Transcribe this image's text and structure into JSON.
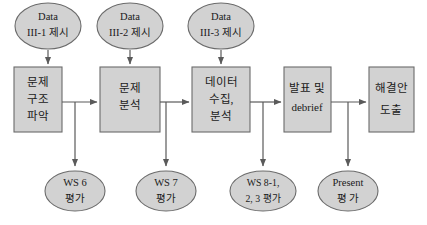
{
  "diagram": {
    "colors": {
      "shape_fill": "#d2d2d2",
      "shape_border": "#6b6b6b",
      "connector": "#5a5a5a",
      "text": "#1a1a1a",
      "background": "#ffffff"
    },
    "input_nodes": [
      {
        "id": "data-3-1",
        "line1": "Data",
        "line2": "III-1 제시"
      },
      {
        "id": "data-3-2",
        "line1": "Data",
        "line2": "III-2 제시"
      },
      {
        "id": "data-3-3",
        "line1": "Data",
        "line2": "III-3 제시"
      }
    ],
    "process_nodes": [
      {
        "id": "problem-structure",
        "line1": "문제",
        "line2": "구조",
        "line3": "파악"
      },
      {
        "id": "problem-analysis",
        "line1": "문제",
        "line2": "분석",
        "line3": ""
      },
      {
        "id": "data-collection",
        "line1": "데이터",
        "line2": "수집,",
        "line3": "분석"
      },
      {
        "id": "presentation-debrief",
        "line1": "발표 및",
        "line2": "debrief",
        "line3": ""
      },
      {
        "id": "solution-derivation",
        "line1": "해결안",
        "line2": "도출",
        "line3": ""
      }
    ],
    "evaluation_nodes": [
      {
        "id": "ws-6",
        "line1": "WS 6",
        "line2": "평가"
      },
      {
        "id": "ws-7",
        "line1": "WS 7",
        "line2": "평가"
      },
      {
        "id": "ws-8",
        "line1": "WS 8-1,",
        "line2": "2, 3 평가"
      },
      {
        "id": "present",
        "line1": "Present",
        "line2": "평 가"
      }
    ]
  }
}
